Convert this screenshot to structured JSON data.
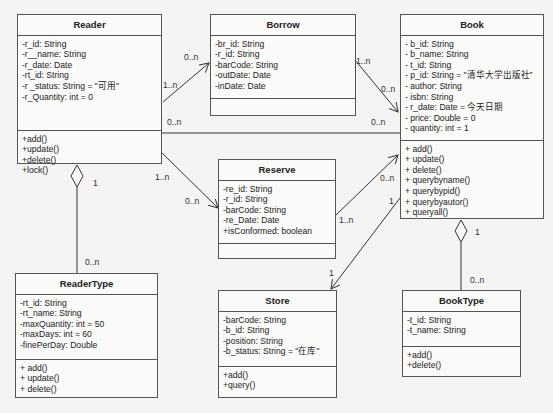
{
  "classes": {
    "reader": {
      "name": "Reader",
      "attributes": [
        "-r_id: String",
        "-r__name: String",
        "-r_date: Date",
        "-rt_id: String",
        "-r _status: String = \"可用\"",
        "-r_Quantity: int = 0"
      ],
      "methods": [
        "+add()",
        "+update()",
        "+delete()",
        "+lock()"
      ]
    },
    "borrow": {
      "name": "Borrow",
      "attributes": [
        "-br_id: String",
        "-r_id: String",
        "-barCode: String",
        "-outDate: Date",
        "-inDate: Date"
      ],
      "methods": []
    },
    "book": {
      "name": "Book",
      "attributes": [
        "- b_id: String",
        "- b_name: String",
        "- t_id: String",
        "- p_id: String = \"清华大学出版社\"",
        "- author: String",
        "- isbn: String",
        "- r_date: Date = 今天日期",
        "- price: Double = 0",
        "- quantity: int = 1"
      ],
      "methods": [
        "+ add()",
        "+ update()",
        "+ delete()",
        "+ querybyname()",
        "+ querybypid()",
        "+ querybyautor()",
        "+ queryall()"
      ]
    },
    "reserve": {
      "name": "Reserve",
      "attributes": [
        "-re_id: String",
        "-r_id: String",
        "-barCode: String",
        "-re_Date: Date",
        "+isConformed: boolean"
      ],
      "methods": []
    },
    "readertype": {
      "name": "ReaderType",
      "attributes": [
        "-rt_id: String",
        "-rt_name: String",
        "-maxQuantity: int = 50",
        "-maxDays: int = 60",
        "-finePerDay: Double"
      ],
      "methods": [
        "+ add()",
        "+ update()",
        "+ delete()"
      ]
    },
    "store": {
      "name": "Store",
      "attributes": [
        "-barCode: String",
        "-b_id: String",
        "-position: String",
        "-b_status: String = \"在库\""
      ],
      "methods": [
        "+add()",
        "+query()"
      ]
    },
    "booktype": {
      "name": "BookType",
      "attributes": [
        "-t_id: String",
        "-t_name: String"
      ],
      "methods": [
        "+add()",
        "+delete()"
      ]
    }
  },
  "multiplicities": {
    "reader_borrow_src": "1..n",
    "reader_borrow_dst": "0..n",
    "borrow_book_src": "1..n",
    "borrow_book_dst": "0..n",
    "reader_book_src": "0..n",
    "reader_book_dst": "0..n",
    "reader_reserve_src": "1..n",
    "reader_reserve_dst": "0..n",
    "reserve_book_src": "1..n",
    "reserve_book_dst": "0..n",
    "book_store_src": "1",
    "book_store_dst": "1",
    "reader_readertype_src": "1",
    "reader_readertype_dst": "0..n",
    "book_booktype_src": "1",
    "book_booktype_dst": "0..n"
  }
}
